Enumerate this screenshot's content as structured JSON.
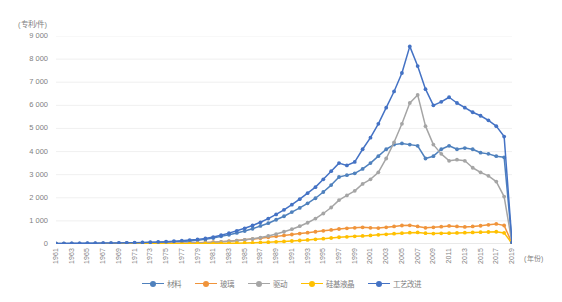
{
  "chart_data": {
    "type": "line",
    "title": "",
    "xlabel": "(年份)",
    "ylabel": "(专利/件)",
    "ylim": [
      0,
      9000
    ],
    "ytick_labels": [
      "9 000",
      "8 000",
      "7 000",
      "6 000",
      "5 000",
      "4 000",
      "3 000",
      "2 000",
      "1 000",
      "0"
    ],
    "ytick_values": [
      9000,
      8000,
      7000,
      6000,
      5000,
      4000,
      3000,
      2000,
      1000,
      0
    ],
    "grid": true,
    "legend_position": "bottom",
    "x": [
      1961,
      1962,
      1963,
      1964,
      1965,
      1966,
      1967,
      1968,
      1969,
      1970,
      1971,
      1972,
      1973,
      1974,
      1975,
      1976,
      1977,
      1978,
      1979,
      1980,
      1981,
      1982,
      1983,
      1984,
      1985,
      1986,
      1987,
      1988,
      1989,
      1990,
      1991,
      1992,
      1993,
      1994,
      1995,
      1996,
      1997,
      1998,
      1999,
      2000,
      2001,
      2002,
      2003,
      2004,
      2005,
      2006,
      2007,
      2008,
      2009,
      2010,
      2011,
      2012,
      2013,
      2014,
      2015,
      2016,
      2017,
      2018,
      2019
    ],
    "xtick_labels": [
      "1961",
      "1963",
      "1965",
      "1967",
      "1969",
      "1971",
      "1973",
      "1975",
      "1977",
      "1979",
      "1981",
      "1983",
      "1985",
      "1987",
      "1989",
      "1991",
      "1993",
      "1995",
      "1997",
      "1999",
      "2001",
      "2003",
      "2005",
      "2007",
      "2009",
      "2011",
      "2013",
      "2015",
      "2017",
      "2019"
    ],
    "series": [
      {
        "name": "材料",
        "color": "#4f81bd",
        "values": [
          20,
          20,
          25,
          25,
          30,
          30,
          35,
          35,
          40,
          45,
          50,
          55,
          60,
          70,
          80,
          95,
          110,
          130,
          160,
          200,
          260,
          330,
          400,
          480,
          560,
          660,
          780,
          900,
          1050,
          1200,
          1380,
          1560,
          1760,
          1980,
          2250,
          2550,
          2900,
          2980,
          3060,
          3250,
          3500,
          3800,
          4100,
          4300,
          4350,
          4300,
          4250,
          3700,
          3800,
          4100,
          4250,
          4100,
          4150,
          4100,
          3950,
          3900,
          3800,
          3750,
          60
        ]
      },
      {
        "name": "玻璃",
        "color": "#f0943b",
        "values": [
          5,
          5,
          5,
          8,
          8,
          10,
          10,
          12,
          12,
          15,
          15,
          18,
          20,
          22,
          25,
          30,
          35,
          40,
          50,
          60,
          75,
          95,
          120,
          150,
          180,
          215,
          250,
          290,
          330,
          370,
          410,
          450,
          490,
          530,
          570,
          610,
          650,
          680,
          700,
          720,
          700,
          690,
          720,
          760,
          800,
          810,
          760,
          700,
          720,
          750,
          780,
          760,
          740,
          760,
          790,
          830,
          870,
          800,
          40
        ]
      },
      {
        "name": "驱动",
        "color": "#a5a5a5",
        "values": [
          3,
          3,
          3,
          5,
          5,
          6,
          6,
          8,
          8,
          10,
          12,
          14,
          16,
          18,
          22,
          26,
          32,
          38,
          46,
          58,
          72,
          92,
          115,
          145,
          180,
          225,
          280,
          350,
          430,
          530,
          640,
          770,
          920,
          1100,
          1320,
          1580,
          1900,
          2100,
          2300,
          2600,
          2800,
          3100,
          3700,
          4400,
          5200,
          6100,
          6450,
          5100,
          4300,
          3900,
          3600,
          3650,
          3600,
          3300,
          3100,
          2950,
          2700,
          2050,
          50
        ]
      },
      {
        "name": "硅基液晶",
        "color": "#ffc000",
        "values": [
          2,
          2,
          2,
          2,
          3,
          3,
          3,
          4,
          4,
          5,
          5,
          6,
          6,
          7,
          8,
          9,
          10,
          12,
          14,
          17,
          20,
          25,
          30,
          36,
          44,
          53,
          64,
          77,
          92,
          110,
          130,
          152,
          176,
          202,
          230,
          260,
          292,
          310,
          330,
          350,
          370,
          395,
          420,
          445,
          470,
          490,
          500,
          470,
          450,
          460,
          470,
          480,
          490,
          500,
          510,
          520,
          530,
          480,
          20
        ]
      },
      {
        "name": "工艺改进",
        "color": "#4472c4",
        "values": [
          25,
          25,
          28,
          30,
          32,
          35,
          38,
          42,
          46,
          52,
          58,
          66,
          76,
          88,
          102,
          120,
          142,
          168,
          200,
          240,
          300,
          380,
          470,
          570,
          680,
          800,
          940,
          1100,
          1280,
          1480,
          1700,
          1940,
          2200,
          2460,
          2800,
          3150,
          3500,
          3400,
          3550,
          4100,
          4600,
          5200,
          5900,
          6600,
          7400,
          8550,
          7700,
          6700,
          6000,
          6150,
          6350,
          6100,
          5900,
          5700,
          5550,
          5350,
          5100,
          4650,
          70
        ]
      }
    ]
  }
}
